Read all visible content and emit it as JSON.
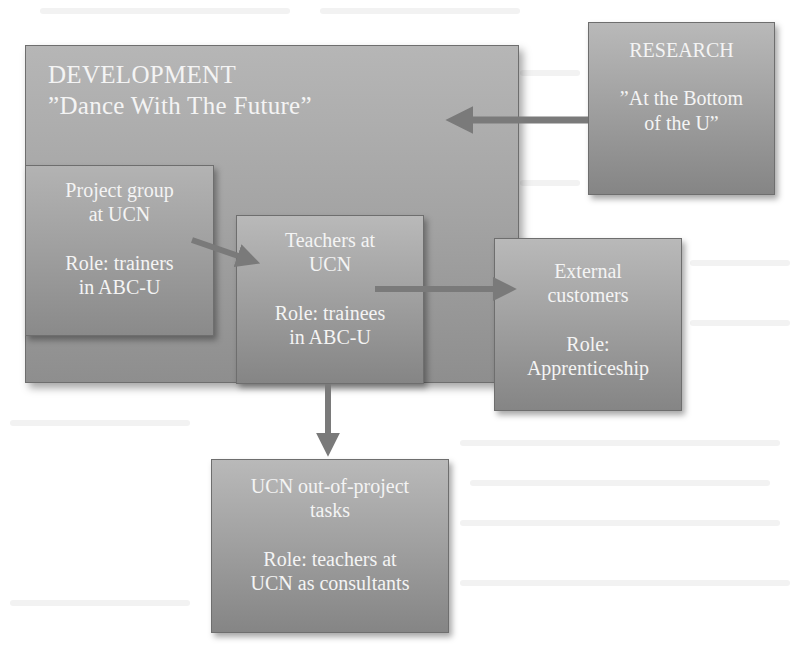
{
  "diagram": {
    "colors": {
      "box_top": "#b9b9b9",
      "box_bottom": "#858585",
      "border": "#6e6e6e",
      "text": "#f4f4f4",
      "arrow": "#7a7a7a"
    },
    "development": {
      "title": "DEVELOPMENT",
      "subtitle": "”Dance With The Future”"
    },
    "research": {
      "title": "RESEARCH",
      "subtitle_line1": "”At the Bottom",
      "subtitle_line2": "of the U”"
    },
    "project_group": {
      "line1": "Project group",
      "line2": "at UCN",
      "role_line1": "Role: trainers",
      "role_line2": "in ABC-U"
    },
    "teachers": {
      "line1": "Teachers at",
      "line2": "UCN",
      "role_line1": "Role: trainees",
      "role_line2": "in ABC-U"
    },
    "external": {
      "line1": "External",
      "line2": "customers",
      "role_line1": "Role:",
      "role_line2": "Apprenticeship"
    },
    "ucn_tasks": {
      "line1": "UCN out-of-project",
      "line2": "tasks",
      "role_line1": "Role: teachers at",
      "role_line2": "UCN as consultants"
    },
    "arrows": [
      {
        "from": "research",
        "to": "development"
      },
      {
        "from": "project_group",
        "to": "teachers"
      },
      {
        "from": "teachers",
        "to": "external"
      },
      {
        "from": "teachers",
        "to": "ucn_tasks"
      }
    ]
  }
}
